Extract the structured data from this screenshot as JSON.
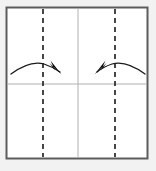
{
  "figure": {
    "name": "folding-diagram",
    "background_color": "#f2f2f2",
    "panel_fill": "#ffffff",
    "frame": {
      "name": "outer-frame",
      "x": 6.5,
      "y": 7.5,
      "width": 141,
      "height": 151,
      "stroke_color": "#5c5c5c",
      "stroke_width": 2
    },
    "axes": [
      {
        "name": "vertical-center-axis",
        "orientation": "vertical",
        "position": 78,
        "from": 8,
        "to": 158,
        "stroke_color": "#b0b0b0",
        "stroke_width": 1,
        "style": "solid"
      },
      {
        "name": "horizontal-center-axis",
        "orientation": "horizontal",
        "position": 84,
        "from": 7,
        "to": 147,
        "stroke_color": "#b0b0b0",
        "stroke_width": 1,
        "style": "solid"
      }
    ],
    "fold_lines": [
      {
        "name": "left-fold-line",
        "orientation": "vertical",
        "position": 43,
        "from": 9,
        "to": 157,
        "stroke_color": "#1a1a1a",
        "stroke_width": 1.6,
        "style": "dashed",
        "dash_pattern": "5,4"
      },
      {
        "name": "right-fold-line",
        "orientation": "vertical",
        "position": 115,
        "from": 9,
        "to": 157,
        "stroke_color": "#1a1a1a",
        "stroke_width": 1.6,
        "style": "dashed",
        "dash_pattern": "5,4"
      }
    ],
    "arrows": [
      {
        "name": "left-fold-arrow",
        "direction": "inward-right",
        "path": "M 11 74 Q 30 60 44 64 Q 53 67 60 72",
        "stroke_color": "#1a1a1a",
        "stroke_width": 1.3,
        "head_points": "60.5,73.5 49,63.5 55,70.5 51.5,61",
        "head_color": "#000000"
      },
      {
        "name": "right-fold-arrow",
        "direction": "inward-left",
        "path": "M 145 74 Q 126 60 112 64 Q 103 67 97 72",
        "stroke_color": "#1a1a1a",
        "stroke_width": 1.3,
        "head_points": "96.5,73.5 108,63.5 102,70.5 105.5,61",
        "head_color": "#000000"
      }
    ]
  }
}
